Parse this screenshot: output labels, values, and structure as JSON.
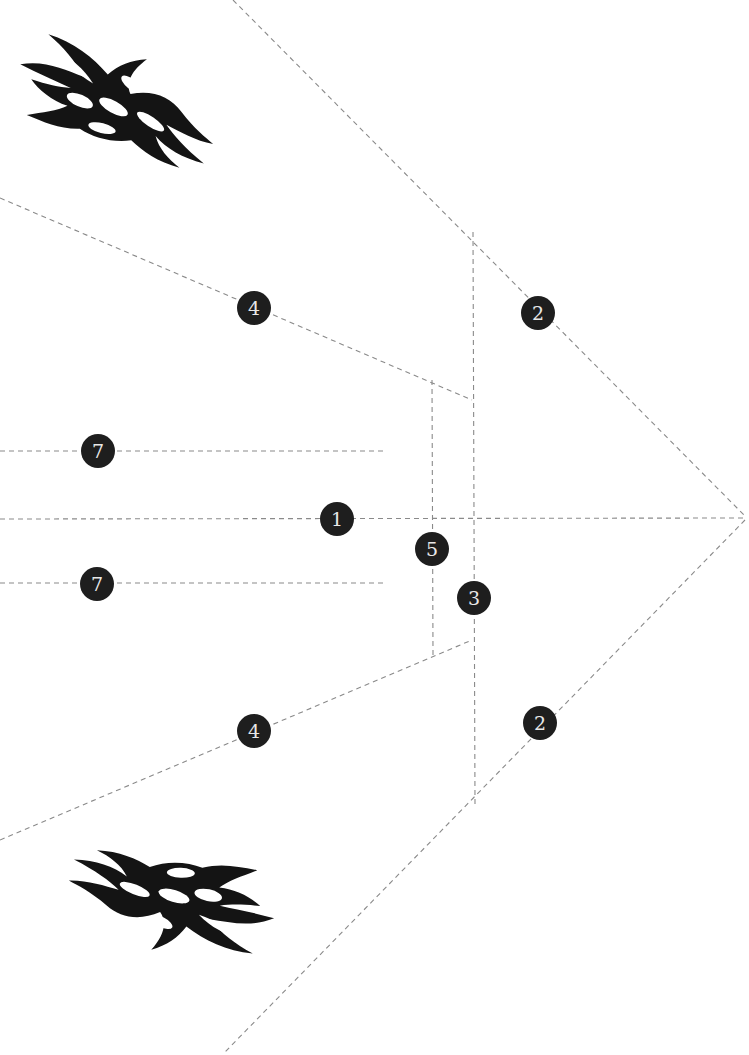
{
  "diagram": {
    "type": "paper-airplane-fold-template",
    "background": "#ffffff",
    "line_color": "#8a8a8a",
    "badge_color": "#1e1e1e",
    "badge_text_color": "#e8e8e8",
    "fold_lines": [
      {
        "id": "fold-2-top",
        "x1": 233,
        "y1": 0,
        "x2": 745,
        "y2": 516
      },
      {
        "id": "fold-2-bottom",
        "x1": 745,
        "y1": 520,
        "x2": 225,
        "y2": 1052
      },
      {
        "id": "fold-1-center",
        "x1": 0,
        "y1": 519,
        "x2": 745,
        "y2": 518
      },
      {
        "id": "fold-4-top",
        "x1": 0,
        "y1": 198,
        "x2": 472,
        "y2": 400
      },
      {
        "id": "fold-4-bottom",
        "x1": 0,
        "y1": 840,
        "x2": 472,
        "y2": 640
      },
      {
        "id": "fold-3-vertical",
        "x1": 473,
        "y1": 232,
        "x2": 475,
        "y2": 805
      },
      {
        "id": "fold-5-vertical",
        "x1": 432,
        "y1": 380,
        "x2": 433,
        "y2": 655
      },
      {
        "id": "fold-7-top",
        "x1": 0,
        "y1": 451,
        "x2": 387,
        "y2": 451
      },
      {
        "id": "fold-7-bottom",
        "x1": 0,
        "y1": 583,
        "x2": 387,
        "y2": 583
      }
    ],
    "badges": [
      {
        "label": "4",
        "x": 254,
        "y": 308
      },
      {
        "label": "2",
        "x": 538,
        "y": 313
      },
      {
        "label": "7",
        "x": 98,
        "y": 451
      },
      {
        "label": "1",
        "x": 337,
        "y": 519
      },
      {
        "label": "5",
        "x": 432,
        "y": 549
      },
      {
        "label": "3",
        "x": 474,
        "y": 598
      },
      {
        "label": "7",
        "x": 97,
        "y": 584
      },
      {
        "label": "4",
        "x": 254,
        "y": 731
      },
      {
        "label": "2",
        "x": 540,
        "y": 723
      }
    ],
    "decals": [
      {
        "name": "flame-decal-top",
        "icon": "flame-icon",
        "x": 12,
        "y": 35,
        "w": 205,
        "h": 130,
        "flip": false
      },
      {
        "name": "flame-decal-bottom",
        "icon": "flame-icon",
        "x": 72,
        "y": 838,
        "w": 205,
        "h": 130,
        "flip": true
      }
    ]
  }
}
